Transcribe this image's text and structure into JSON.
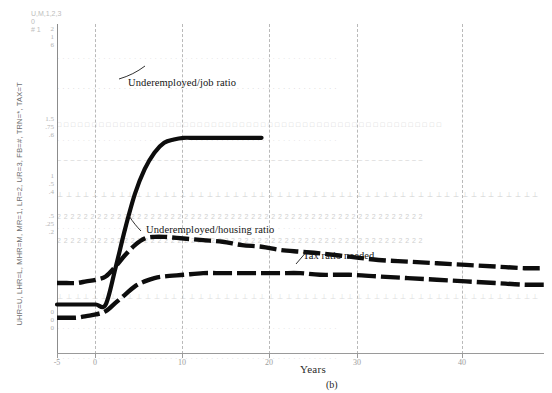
{
  "figure": {
    "panel_caption": "(b)",
    "xlabel": "Years",
    "y_axis_description": "UHR=U, LHR=L, MHR=M, MR=1, LR=2, UR=3, FB=#, TRN=*, TAX=T",
    "corner_key": [
      "U,M,1,2,3",
      "0",
      "# 1"
    ]
  },
  "annotations": [
    {
      "text": "Underemployed/job ratio",
      "name": "annotation-underemployed-job-ratio"
    },
    {
      "text": "Underemployed/housing ratio",
      "name": "annotation-underemployed-housing-ratio"
    },
    {
      "text": "Tax ratio needed",
      "name": "annotation-tax-ratio-needed"
    }
  ],
  "x_ticks": [
    {
      "label": "-5",
      "x": 0
    },
    {
      "label": "0",
      "x": 38
    },
    {
      "label": "10",
      "x": 125
    },
    {
      "label": "20",
      "x": 212
    },
    {
      "label": "30",
      "x": 300
    },
    {
      "label": "40",
      "x": 405
    }
  ],
  "y_clusters": [
    {
      "top": 25,
      "values": [
        "2",
        "1",
        "6"
      ]
    },
    {
      "top": 115,
      "values": [
        "1.5",
        ".75",
        ".6"
      ]
    },
    {
      "top": 172,
      "values": [
        "1",
        ".5",
        ".4"
      ]
    },
    {
      "top": 212,
      "values": [
        ".5",
        ".25",
        ".2"
      ]
    },
    {
      "top": 308,
      "values": [
        "0",
        "0",
        "0"
      ]
    }
  ],
  "marker_rows": [
    {
      "top": 30,
      "glyph": "·",
      "shade": "faintest",
      "gap": 9
    },
    {
      "top": 60,
      "glyph": "·",
      "shade": "faint",
      "gap": 9
    },
    {
      "top": 96,
      "glyph": "□",
      "shade": "faint",
      "gap": 9
    },
    {
      "top": 112,
      "glyph": "·",
      "shade": "faintest",
      "gap": 9
    },
    {
      "top": 131,
      "glyph": "–",
      "shade": "faint",
      "gap": 9
    },
    {
      "top": 166,
      "glyph": "⊥",
      "shade": "faint",
      "gap": 9
    },
    {
      "top": 188,
      "glyph": "2",
      "shade": "faint",
      "gap": 9
    },
    {
      "top": 200,
      "glyph": "·",
      "shade": "faintest",
      "gap": 9
    },
    {
      "top": 212,
      "glyph": "2",
      "shade": "faint",
      "gap": 9
    },
    {
      "top": 268,
      "glyph": "⊥",
      "shade": "faintest",
      "gap": 9
    },
    {
      "top": 300,
      "glyph": "·",
      "shade": "faintest",
      "gap": 9
    },
    {
      "top": 330,
      "glyph": "·",
      "shade": "faintest",
      "gap": 9
    }
  ],
  "chart_data": {
    "type": "line",
    "title": "",
    "subtitle": "",
    "xlabel": "Years",
    "ylabel": "UHR=U, LHR=L, MHR=M, MR=1, LR=2, UR=3, FB=#, TRN=*, TAX=T",
    "xlim": [
      -5,
      45
    ],
    "ylim": [
      0,
      2
    ],
    "grid": true,
    "legend": "inline-annotations",
    "x_tick_labels": [
      "-5",
      "0",
      "10",
      "20",
      "30",
      "40"
    ],
    "y_tick_labels": [
      "0",
      ".5",
      "1",
      "1.5",
      "2"
    ],
    "series": [
      {
        "name": "Underemployed/job ratio",
        "style": "solid-thick",
        "x": [
          -5,
          -4,
          -3,
          -2,
          -1,
          0,
          1,
          2,
          3,
          4,
          5,
          6,
          7,
          8,
          9,
          10,
          12,
          14,
          16
        ],
        "y": [
          0.3,
          0.3,
          0.3,
          0.3,
          0.3,
          0.3,
          0.52,
          0.76,
          0.97,
          1.12,
          1.22,
          1.28,
          1.3,
          1.31,
          1.31,
          1.31,
          1.31,
          1.31,
          1.31
        ]
      },
      {
        "name": "Underemployed/housing ratio",
        "style": "dashed-thick",
        "x": [
          -5,
          -4,
          -3,
          -2,
          -1,
          0,
          1,
          2,
          3,
          4,
          5,
          6,
          8,
          10,
          12,
          14,
          16,
          18,
          20,
          22,
          25,
          28,
          31,
          34,
          37,
          40,
          43,
          45
        ],
        "y": [
          0.43,
          0.43,
          0.43,
          0.44,
          0.45,
          0.47,
          0.53,
          0.6,
          0.66,
          0.7,
          0.71,
          0.71,
          0.7,
          0.69,
          0.68,
          0.66,
          0.65,
          0.63,
          0.62,
          0.61,
          0.59,
          0.57,
          0.56,
          0.55,
          0.54,
          0.53,
          0.52,
          0.52
        ]
      },
      {
        "name": "Tax ratio needed",
        "style": "dashed-thick",
        "x": [
          -5,
          -4,
          -3,
          -2,
          -1,
          0,
          1,
          2,
          3,
          4,
          5,
          6,
          8,
          10,
          12,
          14,
          16,
          18,
          20,
          22,
          25,
          28,
          31,
          34,
          37,
          40,
          43,
          45
        ],
        "y": [
          0.22,
          0.22,
          0.22,
          0.23,
          0.24,
          0.26,
          0.31,
          0.36,
          0.41,
          0.44,
          0.46,
          0.47,
          0.48,
          0.49,
          0.49,
          0.49,
          0.49,
          0.49,
          0.49,
          0.48,
          0.48,
          0.47,
          0.46,
          0.45,
          0.44,
          0.43,
          0.42,
          0.42
        ]
      }
    ]
  }
}
